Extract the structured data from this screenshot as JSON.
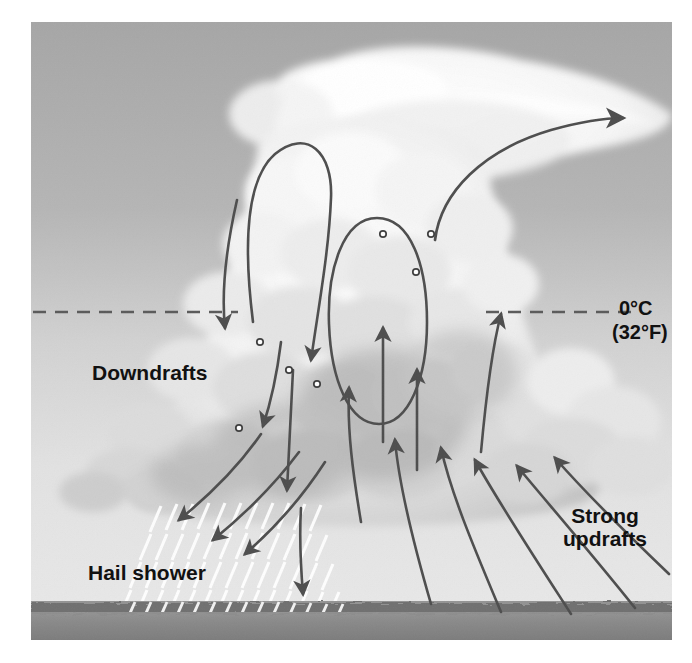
{
  "figure": {
    "kind": "weather-diagram",
    "colors": {
      "sky_top": "#a9a9a9",
      "sky_bottom": "#e7e7e7",
      "cloud": "#f2f2f2",
      "cloud_shadow": "#b9b9b9",
      "arrow": "#4a4a4a",
      "ground": "#8c8c8c",
      "ground_dark": "#7d7d7d",
      "hail_streak": "#ffffff",
      "label_text": "#111111"
    }
  },
  "labels": {
    "downdrafts": "Downdrafts",
    "hail_shower": "Hail shower",
    "strong_updrafts_line1": "Strong",
    "strong_updrafts_line2": "updrafts",
    "freezing_celsius": "0°C",
    "freezing_fahrenheit": "(32°F)"
  },
  "annotations": {
    "freezing_level_y": 312,
    "hailstone_marker_count": 7,
    "downdraft_arrow_count": 7,
    "updraft_arrow_count": 8,
    "recirculation_loop_count": 2,
    "anvil_outflow_arrow_count": 1
  }
}
